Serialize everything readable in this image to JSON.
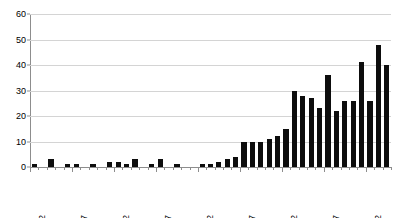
{
  "chart_data": {
    "type": "bar",
    "title": "",
    "subtitle": "",
    "xlabel": "",
    "ylabel": "",
    "ylim": [
      0,
      60
    ],
    "ytick_values": [
      0,
      10,
      20,
      30,
      40,
      50,
      60
    ],
    "ytick_labels": [
      "0",
      "10",
      "20",
      "30",
      "40",
      "50",
      "60"
    ],
    "grid": true,
    "grid_axis": "y",
    "legend": false,
    "legend_position": "none",
    "bar_color": "#0d0d0d",
    "gridline_color": "#d4d4d4",
    "axis_color": "#8d8d8d",
    "background_color": "#ffffff",
    "categories": [
      "1972",
      "1973",
      "1974",
      "1975",
      "1976",
      "1977",
      "1978",
      "1979",
      "1980",
      "1981",
      "1982",
      "1983",
      "1984",
      "1985",
      "1986",
      "1987",
      "1988",
      "1989",
      "1990",
      "1991",
      "1992",
      "1993",
      "1994",
      "1995",
      "1996",
      "1997",
      "1998",
      "1999",
      "2000",
      "2001",
      "2002",
      "2003",
      "2004",
      "2005",
      "2006",
      "2007",
      "2008",
      "2009",
      "2010",
      "2011",
      "2012",
      "2013",
      "2014"
    ],
    "values": [
      1,
      0,
      3,
      0,
      1,
      1,
      0,
      1,
      0,
      2,
      2,
      1,
      3,
      0,
      1,
      3,
      0,
      1,
      0,
      0,
      1,
      1,
      2,
      3,
      4,
      10,
      10,
      10,
      11,
      12,
      15,
      30,
      28,
      27,
      23,
      36,
      22,
      26,
      26,
      41,
      26,
      48,
      40
    ],
    "xtick_labels": [
      "1972",
      "1977",
      "1982",
      "1987",
      "1992",
      "1997",
      "2002",
      "2007",
      "2012"
    ],
    "xtick_categories": [
      "1972",
      "1977",
      "1982",
      "1987",
      "1992",
      "1997",
      "2002",
      "2007",
      "2012"
    ]
  }
}
